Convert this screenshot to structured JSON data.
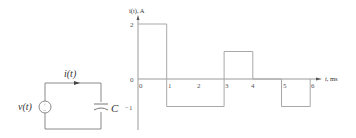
{
  "circuit": {
    "source_label": "v(t)",
    "current_label": "i(t)",
    "capacitor_label": "C",
    "source_plus": "+",
    "source_minus": "−"
  },
  "chart_data": {
    "type": "line",
    "style": "step",
    "title": "",
    "ylabel": "i(t), A",
    "xlabel": "t, ms",
    "x_ticks": [
      "0",
      "1",
      "2",
      "3",
      "4",
      "5",
      "6"
    ],
    "y_ticks": [
      "2",
      "0",
      "−1"
    ],
    "xlim": [
      0,
      6.5
    ],
    "ylim": [
      -1.5,
      2.3
    ],
    "grid": false,
    "legend": "none",
    "segments": [
      {
        "x_start": 0,
        "x_end": 1,
        "value": 2
      },
      {
        "x_start": 1,
        "x_end": 3,
        "value": -1
      },
      {
        "x_start": 3,
        "x_end": 4,
        "value": 1
      },
      {
        "x_start": 4,
        "x_end": 5,
        "value": 0
      },
      {
        "x_start": 5,
        "x_end": 6,
        "value": -1
      }
    ],
    "x": [
      0,
      1,
      1,
      3,
      3,
      4,
      4,
      5,
      5,
      6,
      6
    ],
    "values": [
      2,
      2,
      -1,
      -1,
      1,
      1,
      0,
      0,
      -1,
      -1,
      0
    ]
  }
}
